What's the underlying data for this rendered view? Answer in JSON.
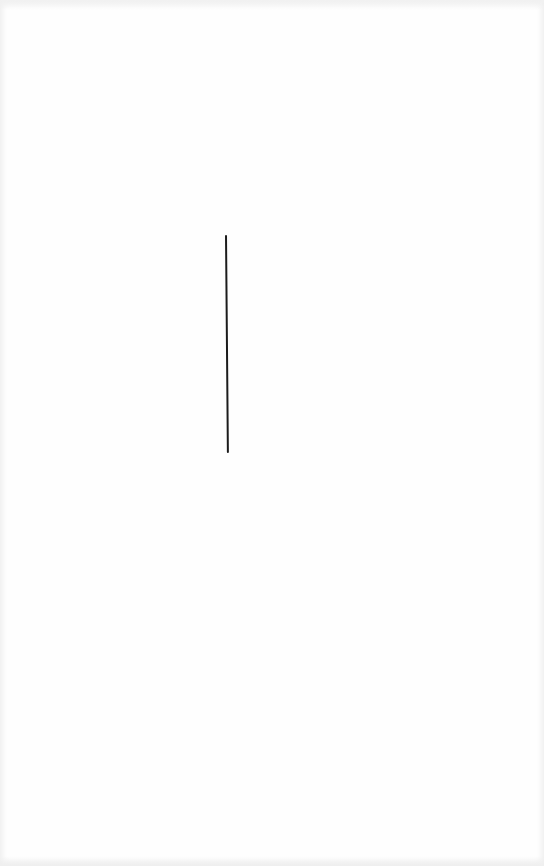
{
  "page": {
    "background_color": "#fefefe",
    "edge_shade_color": "#ececec"
  },
  "content": {
    "vertical_line": {
      "color": "#1c1c1c",
      "x_start": 225,
      "y_start": 235,
      "x_end": 227,
      "y_end": 453,
      "thickness_px": 2
    }
  }
}
